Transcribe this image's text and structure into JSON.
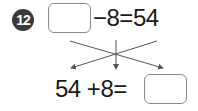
{
  "problem": {
    "number": "12",
    "equation_top": {
      "answer_box": "",
      "rest": "−8=54"
    },
    "equation_bottom": {
      "left": "54 +8=",
      "answer_box": ""
    },
    "arrows": "crossing-arrows-icon"
  },
  "colors": {
    "badge": "#3a3a3a",
    "box_border": "#8a8a8a",
    "arrow": "#555555"
  }
}
